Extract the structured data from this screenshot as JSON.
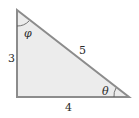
{
  "diagram": {
    "type": "right-triangle",
    "colors": {
      "fill": "#ececec",
      "stroke": "#8c8c8c",
      "text": "#2a2a2a"
    },
    "sides": {
      "vertical": "3",
      "horizontal": "4",
      "hypotenuse": "5"
    },
    "angles": {
      "top": "φ",
      "right": "θ"
    }
  }
}
